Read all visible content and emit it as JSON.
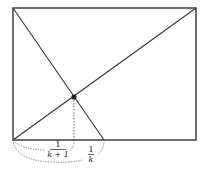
{
  "diagram": {
    "rectangle": {
      "x1": 13,
      "y1": 8,
      "x2": 196,
      "y2": 140,
      "stroke": "#333333"
    },
    "diagonal_main": {
      "from": [
        13,
        140
      ],
      "to": [
        196,
        8
      ]
    },
    "diagonal_steep": {
      "from": [
        13,
        8
      ],
      "to": [
        104,
        140
      ]
    },
    "intersection_point": {
      "x": 74,
      "y": 97,
      "color": "#222222"
    },
    "dropline": {
      "from": [
        74,
        97
      ],
      "to": [
        74,
        140
      ]
    },
    "labels": {
      "short_segment": {
        "numerator": "1",
        "denominator": "k + 1"
      },
      "long_segment": {
        "numerator": "1",
        "denominator": "k"
      }
    }
  }
}
